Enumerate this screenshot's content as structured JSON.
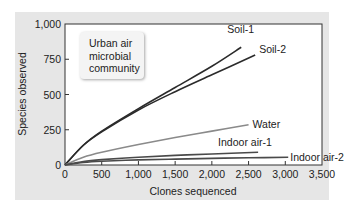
{
  "chart_data": {
    "type": "line",
    "title": "",
    "xlabel": "Clones sequenced",
    "ylabel": "Species observed",
    "xlim": [
      0,
      3500
    ],
    "ylim": [
      0,
      1000
    ],
    "xticks": [
      0,
      500,
      1000,
      1500,
      2000,
      2500,
      3000,
      3500
    ],
    "xtick_labels": [
      "0",
      "500",
      "1,000",
      "1,500",
      "2,000",
      "2,500",
      "3,000",
      "3,500"
    ],
    "yticks": [
      0,
      250,
      500,
      750,
      1000
    ],
    "ytick_labels": [
      "0",
      "250",
      "500",
      "750",
      "1,000"
    ],
    "grid": false,
    "legend": "none (direct labels at line ends)",
    "annotation": "Urban air\nmicrobial\ncommunity",
    "series": [
      {
        "name": "Soil-1",
        "color": "#2b2b2b",
        "x": [
          0,
          250,
          500,
          1000,
          1500,
          2000,
          2400
        ],
        "y": [
          0,
          140,
          240,
          400,
          550,
          700,
          835
        ]
      },
      {
        "name": "Soil-2",
        "color": "#2b2b2b",
        "x": [
          0,
          250,
          500,
          1000,
          1500,
          2000,
          2590
        ],
        "y": [
          0,
          140,
          235,
          390,
          520,
          640,
          780
        ]
      },
      {
        "name": "Water",
        "color": "#8a8a8a",
        "x": [
          0,
          250,
          500,
          1000,
          1500,
          2000,
          2500
        ],
        "y": [
          0,
          55,
          90,
          145,
          195,
          240,
          285
        ]
      },
      {
        "name": "Indoor air-1",
        "color": "#4a4a4a",
        "x": [
          0,
          250,
          500,
          1000,
          1500,
          2000,
          2630
        ],
        "y": [
          0,
          25,
          38,
          55,
          68,
          78,
          90
        ]
      },
      {
        "name": "Indoor air-2",
        "color": "#4a4a4a",
        "x": [
          0,
          250,
          500,
          1000,
          1500,
          2000,
          2500,
          3040
        ],
        "y": [
          0,
          18,
          27,
          36,
          42,
          47,
          51,
          55
        ]
      }
    ]
  }
}
